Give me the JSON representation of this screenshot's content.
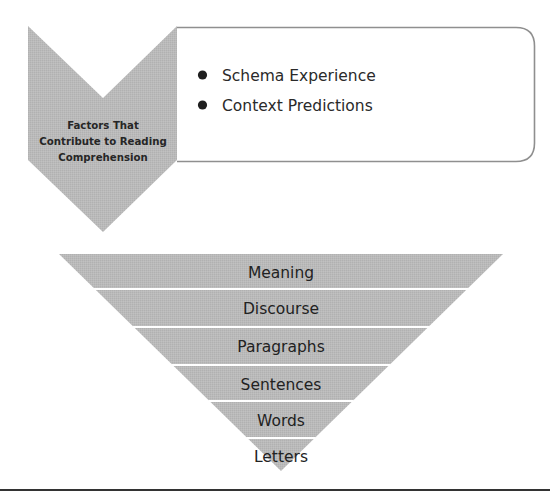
{
  "factors": {
    "label_lines": [
      "Factors That",
      "Contribute to Reading",
      "Comprehension"
    ],
    "items": [
      "Schema Experience",
      "Context Predictions"
    ]
  },
  "pyramid": {
    "levels": [
      "Meaning",
      "Discourse",
      "Paragraphs",
      "Sentences",
      "Words",
      "Letters"
    ]
  },
  "colors": {
    "shape_fill": "#b9b9b9",
    "box_border": "#8f8f8f",
    "text": "#222222",
    "divider": "#ffffff",
    "rule": "#333333"
  }
}
